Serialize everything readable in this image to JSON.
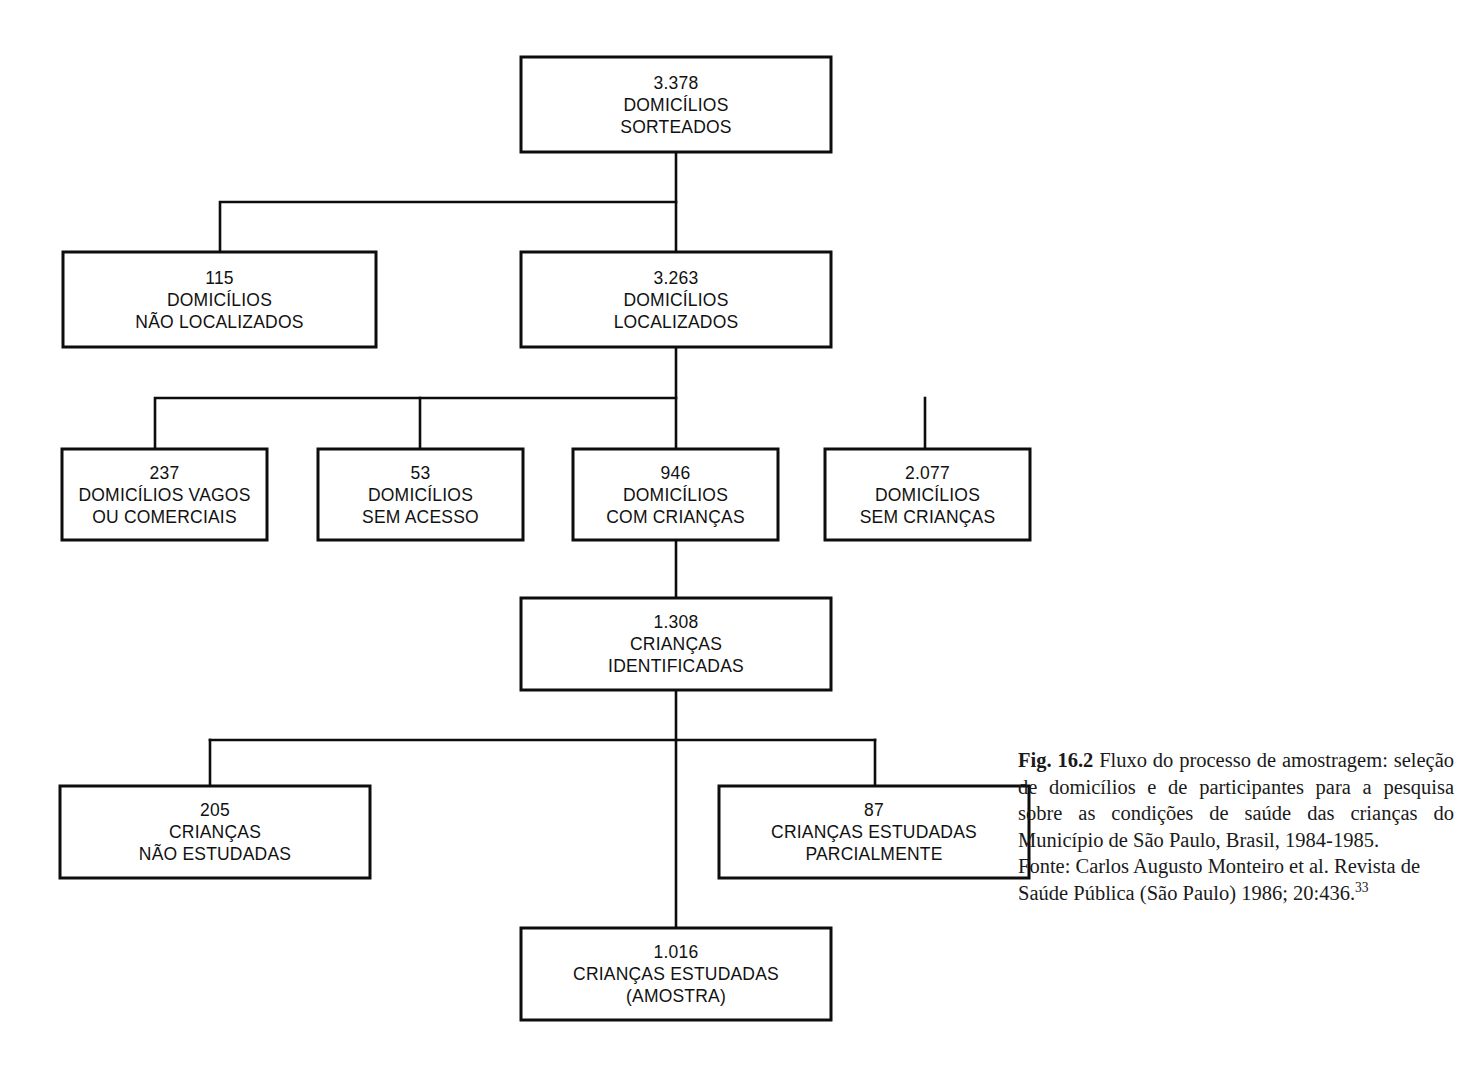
{
  "figure": {
    "title_prefix": "Fig. 16.2",
    "caption_body": " Fluxo do processo de amostragem: seleção de domicílios e de participantes para a pesquisa sobre as condições de saúde das crianças do Município de São Paulo, Brasil, 1984-1985.",
    "source": "Fonte: Carlos Augusto Monteiro et al. Revista de Saúde Pública (São Paulo) 1986; 20:436.",
    "source_ref": "33"
  },
  "chart_data": {
    "type": "diagram",
    "title": "Fluxo do processo de amostragem",
    "nodes": [
      {
        "id": "sorteados",
        "value": "3.378",
        "line2": "DOMICÍLIOS",
        "line3": "SORTEADOS",
        "x": 521,
        "y": 57,
        "w": 310,
        "h": 95
      },
      {
        "id": "nao-localizados",
        "value": "115",
        "line2": "DOMICÍLIOS",
        "line3": "NÃO LOCALIZADOS",
        "x": 63,
        "y": 252,
        "w": 313,
        "h": 95
      },
      {
        "id": "localizados",
        "value": "3.263",
        "line2": "DOMICÍLIOS",
        "line3": "LOCALIZADOS",
        "x": 521,
        "y": 252,
        "w": 310,
        "h": 95
      },
      {
        "id": "vagos",
        "value": "237",
        "line2": "DOMICÍLIOS VAGOS",
        "line3": "OU COMERCIAIS",
        "x": 62,
        "y": 449,
        "w": 205,
        "h": 91
      },
      {
        "id": "sem-acesso",
        "value": "53",
        "line2": "DOMICÍLIOS",
        "line3": "SEM ACESSO",
        "x": 318,
        "y": 449,
        "w": 205,
        "h": 91
      },
      {
        "id": "com-criancas",
        "value": "946",
        "line2": "DOMICÍLIOS",
        "line3": "COM CRIANÇAS",
        "x": 573,
        "y": 449,
        "w": 205,
        "h": 91
      },
      {
        "id": "sem-criancas",
        "value": "2.077",
        "line2": "DOMICÍLIOS",
        "line3": "SEM CRIANÇAS",
        "x": 825,
        "y": 449,
        "w": 205,
        "h": 91
      },
      {
        "id": "identificadas",
        "value": "1.308",
        "line2": "CRIANÇAS",
        "line3": "IDENTIFICADAS",
        "x": 521,
        "y": 598,
        "w": 310,
        "h": 92
      },
      {
        "id": "nao-estudadas",
        "value": "205",
        "line2": "CRIANÇAS",
        "line3": "NÃO ESTUDADAS",
        "x": 60,
        "y": 786,
        "w": 310,
        "h": 92
      },
      {
        "id": "parcialmente",
        "value": "87",
        "line2": "CRIANÇAS ESTUDADAS",
        "line3": "PARCIALMENTE",
        "x": 719,
        "y": 786,
        "w": 310,
        "h": 92
      },
      {
        "id": "amostra",
        "value": "1.016",
        "line2": "CRIANÇAS ESTUDADAS",
        "line3": "(AMOSTRA)",
        "x": 521,
        "y": 928,
        "w": 310,
        "h": 92
      }
    ],
    "edges": [
      {
        "from": "sorteados",
        "to": "nao-localizados"
      },
      {
        "from": "sorteados",
        "to": "localizados"
      },
      {
        "from": "localizados",
        "to": "vagos"
      },
      {
        "from": "localizados",
        "to": "sem-acesso"
      },
      {
        "from": "localizados",
        "to": "com-criancas"
      },
      {
        "from": "localizados",
        "to": "sem-criancas"
      },
      {
        "from": "com-criancas",
        "to": "identificadas"
      },
      {
        "from": "identificadas",
        "to": "nao-estudadas"
      },
      {
        "from": "identificadas",
        "to": "parcialmente"
      },
      {
        "from": "identificadas",
        "to": "amostra"
      }
    ],
    "connector_paths": [
      "M 676 152 L 676 252",
      "M 676 202 L 220 202 L 220 252",
      "M 676 347 L 676 449",
      "M 676 398 L 155 398 L 155 449",
      "M 420 398 L 420 449",
      "M 925 398 L 925 449",
      "M 676 540 L 676 598",
      "M 676 690 L 676 928",
      "M 210 740 L 875 740",
      "M 210 740 L 210 786",
      "M 875 740 L 875 786"
    ]
  }
}
